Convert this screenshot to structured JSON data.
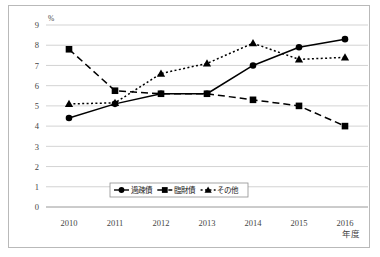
{
  "chart_data": {
    "type": "line",
    "title": "",
    "xlabel": "年度",
    "ylabel": "%",
    "ylim": [
      0,
      9
    ],
    "xlim_categories": [
      "2010",
      "2011",
      "2012",
      "2013",
      "2014",
      "2015",
      "2016"
    ],
    "categories": [
      "2010",
      "2011",
      "2012",
      "2013",
      "2014",
      "2015",
      "2016"
    ],
    "ytick_labels": [
      "0",
      "1",
      "2",
      "3",
      "4",
      "5",
      "6",
      "7",
      "8",
      "9"
    ],
    "ytick_values": [
      0,
      1,
      2,
      3,
      4,
      5,
      6,
      7,
      8,
      9
    ],
    "grid": true,
    "legend_position": "inside-bottom-center",
    "series": [
      {
        "name": "過疎債",
        "marker": "circle",
        "linestyle": "solid",
        "color": "#000000",
        "values": [
          4.4,
          5.1,
          5.6,
          5.6,
          7.0,
          7.9,
          8.3
        ]
      },
      {
        "name": "臨財債",
        "marker": "square",
        "linestyle": "dashed",
        "color": "#000000",
        "values": [
          7.8,
          5.75,
          5.6,
          5.6,
          5.3,
          5.0,
          4.0
        ]
      },
      {
        "name": "その他",
        "marker": "triangle",
        "linestyle": "dotted",
        "color": "#000000",
        "values": [
          5.1,
          5.15,
          6.6,
          7.1,
          8.1,
          7.3,
          7.4
        ]
      }
    ]
  },
  "axis": {
    "y_unit": "%",
    "x_unit": "年度"
  },
  "legend": {
    "items": [
      {
        "label": "過疎債",
        "marker": "circle",
        "linestyle": "solid"
      },
      {
        "label": "臨財債",
        "marker": "square",
        "linestyle": "dashed"
      },
      {
        "label": "その他",
        "marker": "triangle",
        "linestyle": "dotted"
      }
    ]
  }
}
